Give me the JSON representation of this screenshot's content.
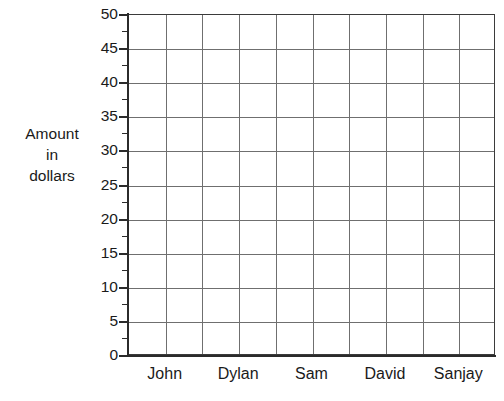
{
  "chart_data": {
    "type": "bar",
    "title": "",
    "subtitle": "",
    "xlabel": "",
    "ylabel": "Amount in dollars",
    "ylabel_lines": [
      "Amount",
      "in",
      "dollars"
    ],
    "categories": [
      "John",
      "Dylan",
      "Sam",
      "David",
      "Sanjay"
    ],
    "values": [
      null,
      null,
      null,
      null,
      null
    ],
    "series": [
      {
        "name": "",
        "values": [
          null,
          null,
          null,
          null,
          null
        ]
      }
    ],
    "ylim": [
      0,
      50
    ],
    "y_major_ticks": [
      0,
      5,
      10,
      15,
      20,
      25,
      30,
      35,
      40,
      45,
      50
    ],
    "y_minor_ticks": [
      2.5,
      7.5,
      12.5,
      17.5,
      22.5,
      27.5,
      32.5,
      37.5,
      42.5,
      47.5
    ],
    "y_tick_labels": [
      "0",
      "5",
      "10",
      "15",
      "20",
      "25",
      "30",
      "35",
      "40",
      "45",
      "50"
    ],
    "y_tick_interval": 5,
    "grid": {
      "horizontal": true,
      "vertical": true,
      "vertical_columns": 10,
      "color": "#6f6f6f"
    },
    "legend": {
      "visible": false,
      "position": "none",
      "entries": []
    },
    "annotations": [],
    "colors": {
      "background": "#ffffff",
      "axis": "#2b2b2b",
      "grid": "#6f6f6f",
      "frame": "#3b3b3b",
      "text": "#1a1a1a"
    }
  },
  "axis_title": {
    "line1": "Amount",
    "line2": "in",
    "line3": "dollars"
  }
}
